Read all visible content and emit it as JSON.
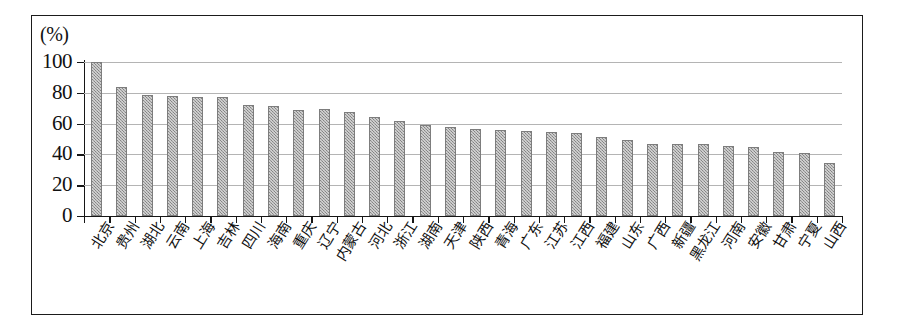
{
  "figure": {
    "unit_label": "(%)",
    "border_color": "#1b1b1b",
    "bar_color": "#9b9b9b",
    "grid_color": "#b4b4b4",
    "axis_color": "#161616"
  },
  "chart_data": {
    "type": "bar",
    "title": "",
    "subtitle": "",
    "xlabel": "",
    "ylabel": "(%)",
    "ylim": [
      0,
      100
    ],
    "yticks": [
      0,
      20,
      40,
      60,
      80,
      100
    ],
    "ytick_labels": [
      "0",
      "20",
      "40",
      "60",
      "80",
      "100"
    ],
    "grid": true,
    "legend": false,
    "legend_position": "none",
    "categories": [
      "北京",
      "贵州",
      "湖北",
      "云南",
      "上海",
      "吉林",
      "四川",
      "海南",
      "重庆",
      "辽宁",
      "内蒙古",
      "河北",
      "浙江",
      "湖南",
      "天津",
      "陕西",
      "青海",
      "广东",
      "江苏",
      "江西",
      "福建",
      "山东",
      "广西",
      "新疆",
      "黑龙江",
      "河南",
      "安徽",
      "甘肃",
      "宁夏",
      "山西"
    ],
    "values": [
      100,
      83.5,
      78.5,
      78,
      77,
      77,
      72,
      71.5,
      69,
      69.5,
      67.5,
      64.5,
      61.5,
      59,
      57.5,
      56.5,
      56,
      55,
      54.5,
      54,
      51,
      49.5,
      47,
      47,
      47,
      45.5,
      45,
      41.5,
      41,
      34.5
    ],
    "series": [
      {
        "name": "",
        "values": [
          100,
          83.5,
          78.5,
          78,
          77,
          77,
          72,
          71.5,
          69,
          69.5,
          67.5,
          64.5,
          61.5,
          59,
          57.5,
          56.5,
          56,
          55,
          54.5,
          54,
          51,
          49.5,
          47,
          47,
          47,
          45.5,
          45,
          41.5,
          41,
          34.5
        ]
      }
    ]
  }
}
